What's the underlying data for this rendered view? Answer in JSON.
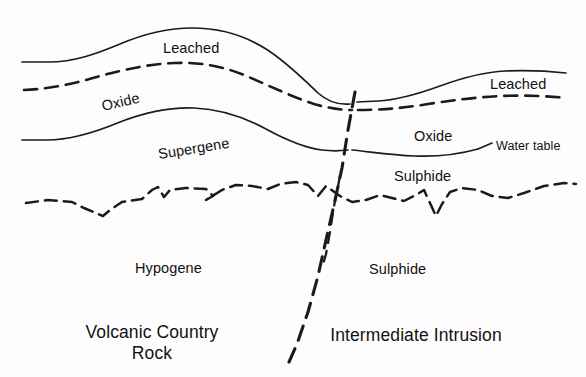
{
  "diagram": {
    "type": "geological-cross-section",
    "background_color": "#fdfdfd",
    "line_color": "#1b1b1b"
  },
  "labels": {
    "leached_left": "Leached",
    "leached_right": "Leached",
    "oxide_left": "Oxide",
    "oxide_right": "Oxide",
    "supergene": "Supergene",
    "sulphide_upper": "Sulphide",
    "sulphide_lower": "Sulphide",
    "hypogene": "Hypogene",
    "water_table": "Water table",
    "volcanic_line1": "Volcanic Country",
    "volcanic_line2": "Rock",
    "intrusion": "Intermediate Intrusion"
  },
  "boundaries": [
    {
      "name": "top-surface-left",
      "style": "solid",
      "description": "Upper solid surface above Leached zone, left block"
    },
    {
      "name": "leached-oxide-contact",
      "style": "dashed",
      "description": "Dashed contact between Leached and Oxide zones"
    },
    {
      "name": "oxide-supergene-contact",
      "style": "solid",
      "description": "Solid contact below Oxide, top of Supergene / water table"
    },
    {
      "name": "water-table",
      "style": "solid",
      "description": "Water table line, right block"
    },
    {
      "name": "supergene-hypogene-contact",
      "style": "jagged-dashed",
      "description": "Irregular dashed contact between Supergene and Hypogene"
    },
    {
      "name": "fault",
      "style": "heavy-dashed",
      "description": "Steeply dipping fault separating volcanic country rock from intermediate intrusion"
    }
  ],
  "zones": {
    "left_block": [
      "Leached",
      "Oxide",
      "Supergene",
      "Hypogene"
    ],
    "right_block": [
      "Leached",
      "Oxide",
      "Sulphide",
      "Sulphide"
    ],
    "left_host": "Volcanic Country Rock",
    "right_host": "Intermediate Intrusion"
  }
}
